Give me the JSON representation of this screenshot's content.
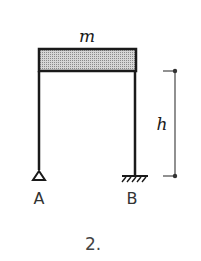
{
  "diagram": {
    "mass_label": "m",
    "height_label": "h",
    "support_left_label": "A",
    "support_right_label": "B",
    "caption": "2.",
    "colors": {
      "stroke": "#1a1a1a",
      "beam_fill": "#bdbdbd",
      "dimension": "#555555"
    }
  }
}
